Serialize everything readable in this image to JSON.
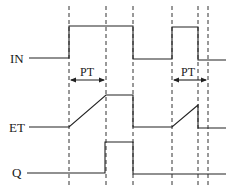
{
  "diagram": {
    "type": "timing-diagram",
    "signals": [
      {
        "id": "IN",
        "label": "IN"
      },
      {
        "id": "ET",
        "label": "ET"
      },
      {
        "id": "Q",
        "label": "Q"
      }
    ],
    "intervals": [
      {
        "label": "PT"
      },
      {
        "label": "PT"
      }
    ],
    "colors": {
      "line": "#222222",
      "guide": "#333333",
      "background": "#ffffff"
    }
  }
}
